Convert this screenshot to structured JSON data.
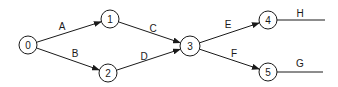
{
  "diagram": {
    "type": "activity-on-arrow network",
    "stroke_color": "#1a1a1a",
    "background": "#ffffff",
    "nodes": [
      {
        "id": "0",
        "label": "0",
        "x": 28,
        "y": 45,
        "r": 9
      },
      {
        "id": "1",
        "label": "1",
        "x": 110,
        "y": 19,
        "r": 9
      },
      {
        "id": "2",
        "label": "2",
        "x": 108,
        "y": 73,
        "r": 9
      },
      {
        "id": "3",
        "label": "3",
        "x": 190,
        "y": 46,
        "r": 10
      },
      {
        "id": "4",
        "label": "4",
        "x": 268,
        "y": 20,
        "r": 9
      },
      {
        "id": "5",
        "label": "5",
        "x": 268,
        "y": 72,
        "r": 9
      }
    ],
    "edges": [
      {
        "label": "A",
        "from": "0",
        "to": "1",
        "arrow": true,
        "lx": 62,
        "ly": 26
      },
      {
        "label": "B",
        "from": "0",
        "to": "2",
        "arrow": true,
        "lx": 75,
        "ly": 53
      },
      {
        "label": "C",
        "from": "1",
        "to": "3",
        "arrow": true,
        "lx": 153,
        "ly": 28
      },
      {
        "label": "D",
        "from": "2",
        "to": "3",
        "arrow": true,
        "lx": 144,
        "ly": 56
      },
      {
        "label": "E",
        "from": "3",
        "to": "4",
        "arrow": true,
        "lx": 228,
        "ly": 24
      },
      {
        "label": "F",
        "from": "3",
        "to": "5",
        "arrow": true,
        "lx": 234,
        "ly": 53
      },
      {
        "label": "H",
        "from": "4",
        "to": null,
        "end_x": 325,
        "end_y": 20,
        "arrow": false,
        "lx": 300,
        "ly": 13
      },
      {
        "label": "G",
        "from": "5",
        "to": null,
        "end_x": 323,
        "end_y": 72,
        "arrow": false,
        "lx": 300,
        "ly": 63
      }
    ]
  }
}
